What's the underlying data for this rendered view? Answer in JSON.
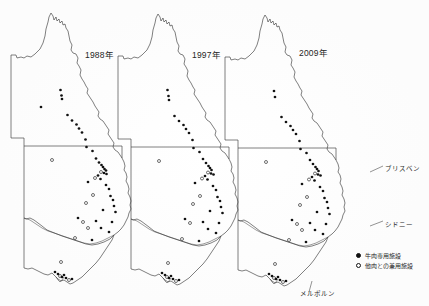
{
  "figure": {
    "title": "",
    "stroke_color": "#333333",
    "dot_filled_color": "#111111",
    "dot_open_color": "#ffffff",
    "background_color": "#ffffff"
  },
  "panels": [
    {
      "id": "panel-1988",
      "year_label": "1988年"
    },
    {
      "id": "panel-1997",
      "year_label": "1997年"
    },
    {
      "id": "panel-2009",
      "year_label": "2009年"
    }
  ],
  "city_labels": [
    {
      "name": "brisbane",
      "text": "ブリスベン"
    },
    {
      "name": "sydney",
      "text": "シドニー"
    },
    {
      "name": "melbourne",
      "text": "メルボルン"
    }
  ],
  "legend": {
    "items": [
      {
        "marker": "filled-circle",
        "label": "牛肉専用施設"
      },
      {
        "marker": "open-circle",
        "label": "他肉との兼用施設"
      }
    ]
  },
  "chart_data": {
    "type": "scatter",
    "title": "",
    "subtitle": "",
    "xlabel": "",
    "ylabel": "",
    "grid": false,
    "legend_position": "bottom-right",
    "map_region": "Eastern Australia (Queensland, New South Wales, Victoria)",
    "categories": [
      "1988年",
      "1997年",
      "2009年"
    ],
    "series": [
      {
        "name": "牛肉専用施設",
        "marker": "filled-circle",
        "counts": [
          49,
          43,
          40
        ]
      },
      {
        "name": "他肉との兼用施設",
        "marker": "open-circle",
        "counts": [
          14,
          12,
          18
        ]
      }
    ],
    "panels": [
      {
        "year": "1988年",
        "points": [
          {
            "x": 60.5,
            "y": 90.0,
            "type": "filled"
          },
          {
            "x": 61.5,
            "y": 95.5,
            "type": "filled"
          },
          {
            "x": 62.0,
            "y": 99.0,
            "type": "filled"
          },
          {
            "x": 41.0,
            "y": 107.0,
            "type": "filled"
          },
          {
            "x": 67.5,
            "y": 115.0,
            "type": "filled"
          },
          {
            "x": 72.0,
            "y": 120.5,
            "type": "filled"
          },
          {
            "x": 76.5,
            "y": 124.5,
            "type": "filled"
          },
          {
            "x": 79.0,
            "y": 128.5,
            "type": "filled"
          },
          {
            "x": 82.0,
            "y": 132.5,
            "type": "filled"
          },
          {
            "x": 85.5,
            "y": 139.5,
            "type": "filled"
          },
          {
            "x": 86.5,
            "y": 147.0,
            "type": "filled"
          },
          {
            "x": 92.5,
            "y": 151.0,
            "type": "filled"
          },
          {
            "x": 52.0,
            "y": 160.0,
            "type": "open"
          },
          {
            "x": 96.0,
            "y": 158.5,
            "type": "filled"
          },
          {
            "x": 99.0,
            "y": 162.5,
            "type": "filled"
          },
          {
            "x": 101.5,
            "y": 165.0,
            "type": "filled"
          },
          {
            "x": 103.0,
            "y": 167.0,
            "type": "filled"
          },
          {
            "x": 104.5,
            "y": 169.0,
            "type": "filled"
          },
          {
            "x": 106.0,
            "y": 170.5,
            "type": "filled"
          },
          {
            "x": 101.0,
            "y": 172.0,
            "type": "open"
          },
          {
            "x": 104.0,
            "y": 173.0,
            "type": "filled"
          },
          {
            "x": 106.5,
            "y": 174.0,
            "type": "filled"
          },
          {
            "x": 98.0,
            "y": 175.5,
            "type": "filled"
          },
          {
            "x": 95.0,
            "y": 178.0,
            "type": "open"
          },
          {
            "x": 100.5,
            "y": 179.0,
            "type": "filled"
          },
          {
            "x": 88.0,
            "y": 182.0,
            "type": "filled"
          },
          {
            "x": 106.0,
            "y": 185.0,
            "type": "filled"
          },
          {
            "x": 109.0,
            "y": 189.0,
            "type": "filled"
          },
          {
            "x": 93.0,
            "y": 195.0,
            "type": "open"
          },
          {
            "x": 110.5,
            "y": 196.0,
            "type": "filled"
          },
          {
            "x": 113.0,
            "y": 200.0,
            "type": "filled"
          },
          {
            "x": 86.0,
            "y": 203.0,
            "type": "open"
          },
          {
            "x": 114.0,
            "y": 206.0,
            "type": "filled"
          },
          {
            "x": 103.0,
            "y": 210.0,
            "type": "filled"
          },
          {
            "x": 115.5,
            "y": 212.0,
            "type": "filled"
          },
          {
            "x": 78.0,
            "y": 218.0,
            "type": "filled"
          },
          {
            "x": 83.0,
            "y": 222.0,
            "type": "open"
          },
          {
            "x": 96.0,
            "y": 221.0,
            "type": "filled"
          },
          {
            "x": 112.0,
            "y": 222.0,
            "type": "filled"
          },
          {
            "x": 88.0,
            "y": 228.0,
            "type": "open"
          },
          {
            "x": 101.0,
            "y": 228.0,
            "type": "filled"
          },
          {
            "x": 109.0,
            "y": 232.0,
            "type": "filled"
          },
          {
            "x": 75.0,
            "y": 238.0,
            "type": "open"
          },
          {
            "x": 92.0,
            "y": 240.0,
            "type": "filled"
          },
          {
            "x": 61.0,
            "y": 262.0,
            "type": "open"
          },
          {
            "x": 55.0,
            "y": 272.0,
            "type": "filled"
          },
          {
            "x": 58.0,
            "y": 274.0,
            "type": "filled"
          },
          {
            "x": 60.0,
            "y": 276.0,
            "type": "open"
          },
          {
            "x": 62.0,
            "y": 277.0,
            "type": "filled"
          },
          {
            "x": 64.0,
            "y": 275.0,
            "type": "filled"
          },
          {
            "x": 66.0,
            "y": 278.0,
            "type": "filled"
          },
          {
            "x": 69.0,
            "y": 280.0,
            "type": "open"
          },
          {
            "x": 72.0,
            "y": 279.0,
            "type": "filled"
          }
        ]
      },
      {
        "year": "1997年",
        "points": [
          {
            "x": 167.5,
            "y": 90.0,
            "type": "filled"
          },
          {
            "x": 168.5,
            "y": 96.0,
            "type": "filled"
          },
          {
            "x": 169.0,
            "y": 100.0,
            "type": "filled"
          },
          {
            "x": 174.5,
            "y": 116.0,
            "type": "filled"
          },
          {
            "x": 179.0,
            "y": 121.0,
            "type": "filled"
          },
          {
            "x": 183.5,
            "y": 125.0,
            "type": "filled"
          },
          {
            "x": 186.0,
            "y": 129.0,
            "type": "filled"
          },
          {
            "x": 189.0,
            "y": 133.0,
            "type": "filled"
          },
          {
            "x": 192.5,
            "y": 140.0,
            "type": "filled"
          },
          {
            "x": 193.5,
            "y": 148.0,
            "type": "filled"
          },
          {
            "x": 199.5,
            "y": 152.0,
            "type": "filled"
          },
          {
            "x": 159.0,
            "y": 161.0,
            "type": "open"
          },
          {
            "x": 203.0,
            "y": 159.0,
            "type": "filled"
          },
          {
            "x": 206.0,
            "y": 163.0,
            "type": "filled"
          },
          {
            "x": 208.5,
            "y": 166.0,
            "type": "filled"
          },
          {
            "x": 210.0,
            "y": 168.0,
            "type": "filled"
          },
          {
            "x": 211.5,
            "y": 170.0,
            "type": "filled"
          },
          {
            "x": 208.0,
            "y": 172.5,
            "type": "open"
          },
          {
            "x": 211.0,
            "y": 173.5,
            "type": "filled"
          },
          {
            "x": 213.5,
            "y": 174.5,
            "type": "filled"
          },
          {
            "x": 205.0,
            "y": 176.0,
            "type": "filled"
          },
          {
            "x": 202.0,
            "y": 178.5,
            "type": "open"
          },
          {
            "x": 207.5,
            "y": 179.5,
            "type": "filled"
          },
          {
            "x": 195.0,
            "y": 183.0,
            "type": "filled"
          },
          {
            "x": 213.0,
            "y": 186.0,
            "type": "filled"
          },
          {
            "x": 216.0,
            "y": 190.0,
            "type": "filled"
          },
          {
            "x": 200.0,
            "y": 196.0,
            "type": "open"
          },
          {
            "x": 217.5,
            "y": 197.0,
            "type": "filled"
          },
          {
            "x": 220.0,
            "y": 201.0,
            "type": "filled"
          },
          {
            "x": 193.0,
            "y": 204.0,
            "type": "open"
          },
          {
            "x": 221.0,
            "y": 207.0,
            "type": "filled"
          },
          {
            "x": 210.0,
            "y": 211.0,
            "type": "filled"
          },
          {
            "x": 222.5,
            "y": 213.0,
            "type": "filled"
          },
          {
            "x": 185.0,
            "y": 219.0,
            "type": "filled"
          },
          {
            "x": 190.0,
            "y": 223.0,
            "type": "open"
          },
          {
            "x": 203.0,
            "y": 222.0,
            "type": "filled"
          },
          {
            "x": 219.0,
            "y": 223.0,
            "type": "filled"
          },
          {
            "x": 208.0,
            "y": 229.0,
            "type": "filled"
          },
          {
            "x": 216.0,
            "y": 233.0,
            "type": "filled"
          },
          {
            "x": 182.0,
            "y": 239.0,
            "type": "open"
          },
          {
            "x": 199.0,
            "y": 241.0,
            "type": "filled"
          },
          {
            "x": 168.0,
            "y": 263.0,
            "type": "open"
          },
          {
            "x": 162.0,
            "y": 273.0,
            "type": "filled"
          },
          {
            "x": 165.0,
            "y": 275.0,
            "type": "filled"
          },
          {
            "x": 167.0,
            "y": 277.0,
            "type": "open"
          },
          {
            "x": 169.0,
            "y": 278.0,
            "type": "filled"
          },
          {
            "x": 171.0,
            "y": 276.0,
            "type": "filled"
          },
          {
            "x": 173.0,
            "y": 279.0,
            "type": "filled"
          },
          {
            "x": 176.0,
            "y": 281.0,
            "type": "open"
          },
          {
            "x": 179.0,
            "y": 280.0,
            "type": "filled"
          }
        ]
      },
      {
        "year": "2009年",
        "points": [
          {
            "x": 274.0,
            "y": 91.0,
            "type": "filled"
          },
          {
            "x": 275.0,
            "y": 97.0,
            "type": "filled"
          },
          {
            "x": 281.5,
            "y": 117.0,
            "type": "filled"
          },
          {
            "x": 286.0,
            "y": 122.0,
            "type": "filled"
          },
          {
            "x": 290.5,
            "y": 126.0,
            "type": "filled"
          },
          {
            "x": 293.0,
            "y": 130.0,
            "type": "filled"
          },
          {
            "x": 296.0,
            "y": 134.0,
            "type": "filled"
          },
          {
            "x": 299.5,
            "y": 141.0,
            "type": "filled"
          },
          {
            "x": 300.5,
            "y": 149.0,
            "type": "filled"
          },
          {
            "x": 306.5,
            "y": 153.0,
            "type": "filled"
          },
          {
            "x": 266.0,
            "y": 162.0,
            "type": "open"
          },
          {
            "x": 310.0,
            "y": 160.0,
            "type": "filled"
          },
          {
            "x": 313.0,
            "y": 164.0,
            "type": "filled"
          },
          {
            "x": 315.5,
            "y": 167.0,
            "type": "filled"
          },
          {
            "x": 317.0,
            "y": 169.0,
            "type": "filled"
          },
          {
            "x": 318.5,
            "y": 171.0,
            "type": "filled"
          },
          {
            "x": 315.0,
            "y": 173.5,
            "type": "open"
          },
          {
            "x": 318.0,
            "y": 174.5,
            "type": "filled"
          },
          {
            "x": 320.5,
            "y": 175.5,
            "type": "filled"
          },
          {
            "x": 312.0,
            "y": 177.0,
            "type": "filled"
          },
          {
            "x": 309.0,
            "y": 179.5,
            "type": "open"
          },
          {
            "x": 314.5,
            "y": 180.5,
            "type": "filled"
          },
          {
            "x": 302.0,
            "y": 184.0,
            "type": "filled"
          },
          {
            "x": 320.0,
            "y": 187.0,
            "type": "filled"
          },
          {
            "x": 323.0,
            "y": 191.0,
            "type": "filled"
          },
          {
            "x": 307.0,
            "y": 197.0,
            "type": "open"
          },
          {
            "x": 324.5,
            "y": 198.0,
            "type": "filled"
          },
          {
            "x": 327.0,
            "y": 202.0,
            "type": "filled"
          },
          {
            "x": 300.0,
            "y": 205.0,
            "type": "open"
          },
          {
            "x": 328.0,
            "y": 208.0,
            "type": "filled"
          },
          {
            "x": 317.0,
            "y": 212.0,
            "type": "filled"
          },
          {
            "x": 329.5,
            "y": 214.0,
            "type": "filled"
          },
          {
            "x": 292.0,
            "y": 220.0,
            "type": "filled"
          },
          {
            "x": 297.0,
            "y": 224.0,
            "type": "open"
          },
          {
            "x": 310.0,
            "y": 223.0,
            "type": "filled"
          },
          {
            "x": 326.0,
            "y": 224.0,
            "type": "filled"
          },
          {
            "x": 302.0,
            "y": 230.0,
            "type": "open"
          },
          {
            "x": 315.0,
            "y": 230.0,
            "type": "filled"
          },
          {
            "x": 323.0,
            "y": 234.0,
            "type": "filled"
          },
          {
            "x": 289.0,
            "y": 240.0,
            "type": "open"
          },
          {
            "x": 306.0,
            "y": 242.0,
            "type": "filled"
          },
          {
            "x": 275.0,
            "y": 264.0,
            "type": "open"
          },
          {
            "x": 269.0,
            "y": 274.0,
            "type": "filled"
          },
          {
            "x": 272.0,
            "y": 276.0,
            "type": "filled"
          },
          {
            "x": 274.0,
            "y": 278.0,
            "type": "open"
          },
          {
            "x": 276.0,
            "y": 279.0,
            "type": "filled"
          },
          {
            "x": 278.0,
            "y": 277.0,
            "type": "filled"
          },
          {
            "x": 280.0,
            "y": 280.0,
            "type": "filled"
          },
          {
            "x": 283.0,
            "y": 282.0,
            "type": "open"
          },
          {
            "x": 286.0,
            "y": 281.0,
            "type": "filled"
          }
        ]
      }
    ]
  }
}
